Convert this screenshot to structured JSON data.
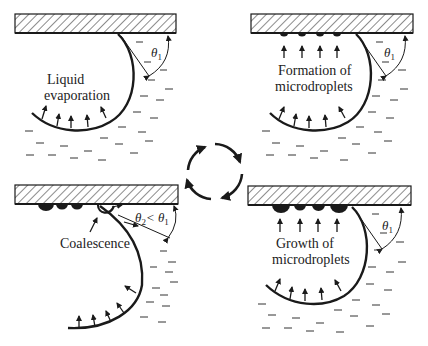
{
  "panels": [
    {
      "id": "top-left",
      "label_lines": [
        "Liquid",
        "evaporation"
      ],
      "angle_label": "θ",
      "angle_sub": "1"
    },
    {
      "id": "top-right",
      "label_lines": [
        "Formation of",
        "microdroplets"
      ],
      "angle_label": "θ",
      "angle_sub": "1"
    },
    {
      "id": "bottom-left",
      "label_lines": [
        "Coalescence"
      ],
      "angle_label": "θ",
      "angle_sub": "2",
      "angle_rel": "< θ",
      "angle_rel_sub": "1"
    },
    {
      "id": "bottom-right",
      "label_lines": [
        "Growth of",
        "microdroplets"
      ],
      "angle_label": "θ",
      "angle_sub": "1"
    }
  ],
  "cycle": {
    "direction": "clockwise",
    "arrows": 4
  }
}
